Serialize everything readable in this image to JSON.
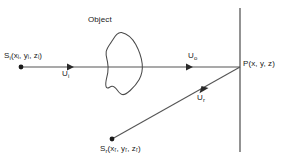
{
  "diagram": {
    "type": "optical-ray-diagram",
    "background_color": "#ffffff",
    "stroke_color": "#3f3f3f",
    "text_color": "#1a1a1a",
    "labels": {
      "object": "Object",
      "source_illumination": "Sᵢ(xᵢ, yᵢ, zᵢ)",
      "source_illumination_base": "S",
      "source_illumination_sub": "i",
      "source_illumination_args": "(xᵢ, yᵢ, zᵢ)",
      "wave_incident": "Uᵢ",
      "wave_incident_base": "U",
      "wave_incident_sub": "i",
      "wave_object": "Uₒ",
      "wave_object_base": "U",
      "wave_object_sub": "o",
      "wave_reference": "Uᵣ",
      "wave_reference_base": "U",
      "wave_reference_sub": "r",
      "point_p": "P(x, y, z)",
      "point_p_base": "P",
      "point_p_args": "(x, y, z)",
      "source_reference": "Sᵣ(xᵣ, yᵣ, zᵣ)",
      "source_reference_base": "S",
      "source_reference_sub": "r",
      "source_reference_args": "(xᵣ, yᵣ, zᵣ)"
    },
    "elements": {
      "recording_plane_label": "recording plane",
      "object_blob_label": "object outline",
      "illumination_ray_label": "illumination ray",
      "reference_ray_label": "reference ray"
    },
    "coordinates": {
      "source_illumination_dot": [
        21,
        67
      ],
      "source_reference_dot": [
        112,
        139
      ],
      "point_p": [
        240,
        67
      ],
      "plane_x": 240,
      "plane_top_y": 8,
      "plane_bottom_y": 152
    }
  }
}
